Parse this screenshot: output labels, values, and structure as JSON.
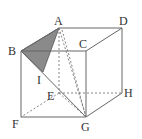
{
  "diagram": {
    "type": "cube",
    "labels": {
      "A": "A",
      "B": "B",
      "C": "C",
      "D": "D",
      "E": "E",
      "F": "F",
      "G": "G",
      "H": "H",
      "I": "I"
    },
    "shaded_region": "triangle ABI",
    "colors": {
      "edge": "#666666",
      "shade": "#888888",
      "background": "#ffffff"
    }
  }
}
